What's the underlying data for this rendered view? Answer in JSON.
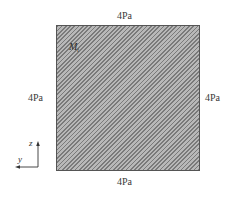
{
  "diagram": {
    "type": "stress-element",
    "edges": {
      "top": {
        "label": "4Pa"
      },
      "bottom": {
        "label": "4Pa"
      },
      "left": {
        "label": "4Pa"
      },
      "right": {
        "label": "4Pa"
      }
    },
    "panel": {
      "fill": "hatched",
      "hatch_color": "#7a7a7a",
      "background_color": "#b8b8b8",
      "inner_label": {
        "symbol": "M",
        "subscript": "t"
      }
    },
    "axes": {
      "vertical": {
        "label": "z",
        "direction": "up"
      },
      "horizontal": {
        "label": "y",
        "direction": "left"
      }
    }
  }
}
